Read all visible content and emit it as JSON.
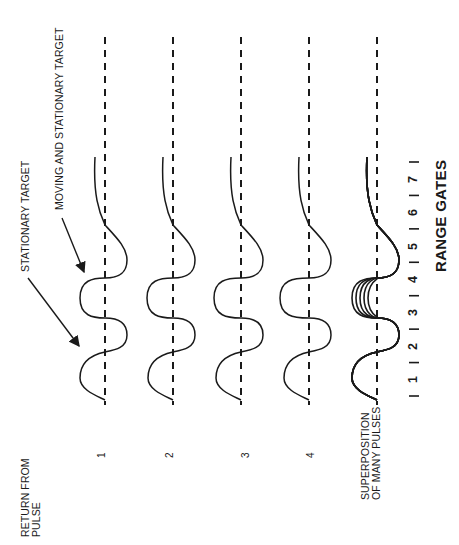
{
  "figure": {
    "annotations": {
      "stationary": "STATIONARY TARGET",
      "moving": "MOVING AND STATIONARY TARGET"
    },
    "row_header": [
      "RETURN FROM",
      "PULSE"
    ],
    "pulses": [
      {
        "label": "1",
        "moving_target_offset": 0
      },
      {
        "label": "2",
        "moving_target_offset": 0.05
      },
      {
        "label": "3",
        "moving_target_offset": 0.1
      },
      {
        "label": "4",
        "moving_target_offset": 0.2
      }
    ],
    "superposition": {
      "label_line1": "SUPERPOSITION",
      "label_line2": "OF MANY PULSES",
      "overlay_count": 5
    },
    "range_gates": {
      "title": "RANGE GATES",
      "gates": [
        "1",
        "2",
        "3",
        "4",
        "5",
        "6",
        "7"
      ]
    },
    "colors": {
      "ink": "#1a1a1a",
      "background": "#ffffff"
    }
  }
}
